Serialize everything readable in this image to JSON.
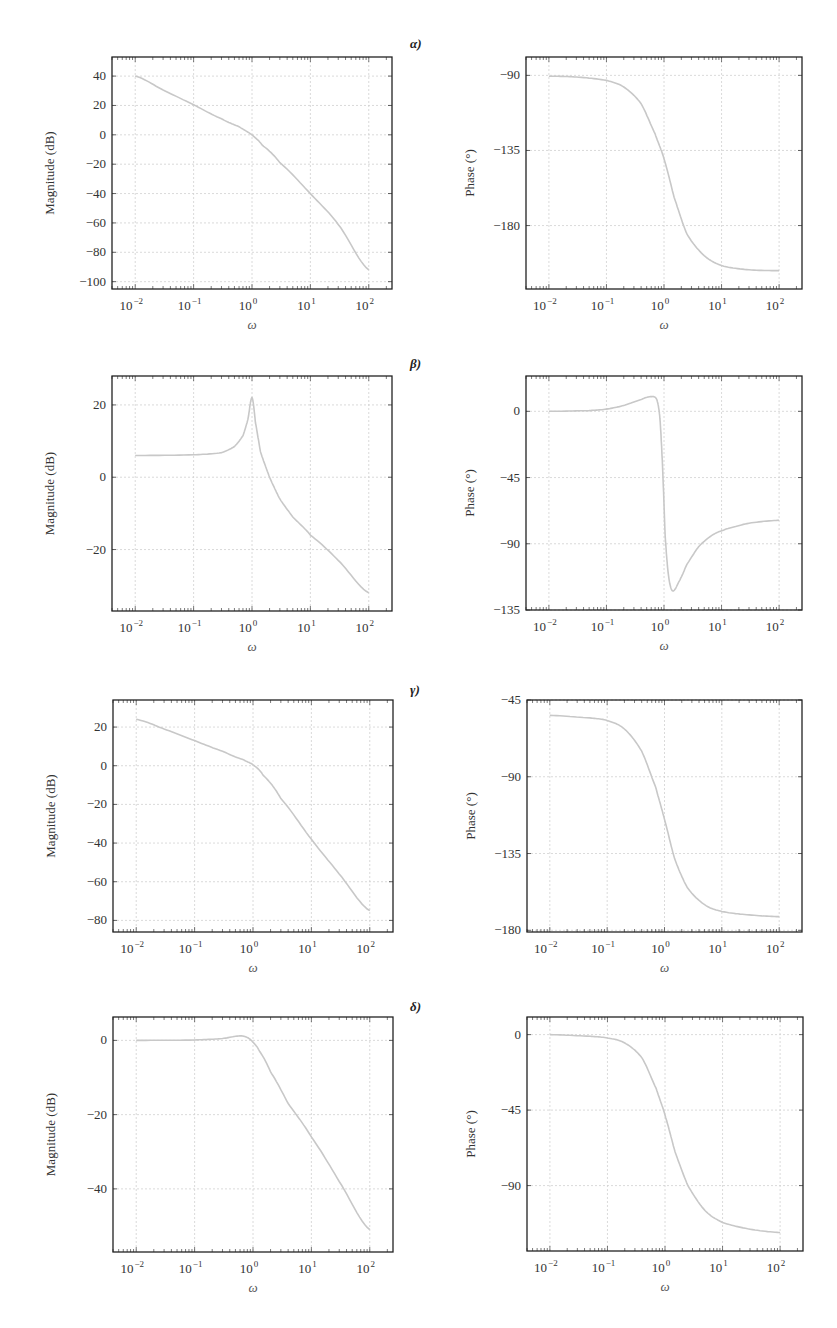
{
  "panel_labels": [
    "α)",
    "β)",
    "γ)",
    "δ)"
  ],
  "colors": {
    "curve": "#c8c8c8",
    "grid": "#d0d0d0",
    "axis": "#222222"
  },
  "chart_data": [
    {
      "id": "alpha-magnitude",
      "panel": "α)",
      "type": "line",
      "xlabel": "ω",
      "ylabel": "Magnitude (dB)",
      "xscale": "log",
      "xlim": [
        0.004,
        250
      ],
      "ylim": [
        -105,
        53
      ],
      "xticks": [
        0.01,
        0.1,
        1,
        10,
        100
      ],
      "xtick_labels": [
        "10^-2",
        "10^-1",
        "10^0",
        "10^1",
        "10^2"
      ],
      "yticks": [
        40,
        20,
        0,
        -20,
        -40,
        -60,
        -80,
        -100
      ],
      "ytick_labels": [
        "40",
        "20",
        "0",
        "−20",
        "−40",
        "−60",
        "−80",
        "−100"
      ],
      "box": [
        112,
        57,
        392,
        289
      ],
      "x": [
        0.01,
        0.03,
        0.1,
        0.3,
        0.6,
        1,
        1.5,
        3,
        10,
        30,
        100
      ],
      "y": [
        40,
        30.5,
        20.5,
        11,
        5.5,
        0,
        -7,
        -19,
        -40,
        -61,
        -92
      ]
    },
    {
      "id": "alpha-phase",
      "panel": "α)",
      "type": "line",
      "xlabel": "ω",
      "ylabel": "Phase (°)",
      "xscale": "log",
      "xlim": [
        0.004,
        250
      ],
      "ylim": [
        -218,
        -79
      ],
      "xticks": [
        0.01,
        0.1,
        1,
        10,
        100
      ],
      "xtick_labels": [
        "10^-2",
        "10^-1",
        "10^0",
        "10^1",
        "10^2"
      ],
      "yticks": [
        -90,
        -135,
        -180
      ],
      "ytick_labels": [
        "−90",
        "−135",
        "−180"
      ],
      "box": [
        526,
        57,
        802,
        289
      ],
      "x": [
        0.01,
        0.03,
        0.1,
        0.2,
        0.4,
        0.7,
        1,
        1.5,
        2.5,
        5,
        10,
        30,
        100
      ],
      "y": [
        -90.5,
        -91,
        -93,
        -97,
        -107,
        -125,
        -140,
        -163,
        -185,
        -198,
        -204,
        -206.5,
        -207
      ]
    },
    {
      "id": "beta-magnitude",
      "panel": "β)",
      "type": "line",
      "xlabel": "ω",
      "ylabel": "Magnitude (dB)",
      "xscale": "log",
      "xlim": [
        0.004,
        250
      ],
      "ylim": [
        -37,
        28
      ],
      "xticks": [
        0.01,
        0.1,
        1,
        10,
        100
      ],
      "xtick_labels": [
        "10^-2",
        "10^-1",
        "10^0",
        "10^1",
        "10^2"
      ],
      "yticks": [
        20,
        0,
        -20
      ],
      "ytick_labels": [
        "20",
        "0",
        "−20"
      ],
      "box": [
        112,
        376,
        392,
        611
      ],
      "x": [
        0.01,
        0.1,
        0.3,
        0.5,
        0.7,
        0.85,
        1,
        1.15,
        1.4,
        2,
        3,
        5,
        10,
        30,
        100
      ],
      "y": [
        6,
        6.2,
        6.8,
        8.5,
        11.5,
        16,
        22,
        15,
        7,
        0,
        -6,
        -11,
        -16,
        -23,
        -32
      ]
    },
    {
      "id": "beta-phase",
      "panel": "β)",
      "type": "line",
      "xlabel": "ω",
      "ylabel": "Phase (°)",
      "xscale": "log",
      "xlim": [
        0.004,
        250
      ],
      "ylim": [
        -135,
        24
      ],
      "xticks": [
        0.01,
        0.1,
        1,
        10,
        100
      ],
      "xtick_labels": [
        "10^-2",
        "10^-1",
        "10^0",
        "10^1",
        "10^2"
      ],
      "yticks": [
        0,
        -45,
        -90,
        -135
      ],
      "ytick_labels": [
        "0",
        "−45",
        "−90",
        "−135"
      ],
      "box": [
        526,
        376,
        802,
        610
      ],
      "x": [
        0.01,
        0.05,
        0.1,
        0.2,
        0.4,
        0.6,
        0.75,
        0.85,
        0.95,
        1.05,
        1.2,
        1.4,
        1.8,
        2.5,
        4,
        7,
        12,
        30,
        100
      ],
      "y": [
        0,
        0.5,
        1.5,
        4,
        8,
        10,
        8,
        -5,
        -40,
        -85,
        -112,
        -122,
        -116,
        -104,
        -92,
        -84,
        -80,
        -76,
        -74
      ]
    },
    {
      "id": "gamma-magnitude",
      "panel": "γ)",
      "type": "line",
      "xlabel": "ω",
      "ylabel": "Magnitude (dB)",
      "xscale": "log",
      "xlim": [
        0.004,
        250
      ],
      "ylim": [
        -86,
        34
      ],
      "xticks": [
        0.01,
        0.1,
        1,
        10,
        100
      ],
      "xtick_labels": [
        "10^-2",
        "10^-1",
        "10^0",
        "10^1",
        "10^2"
      ],
      "yticks": [
        20,
        0,
        -20,
        -40,
        -60,
        -80
      ],
      "ytick_labels": [
        "20",
        "0",
        "−20",
        "−40",
        "−60",
        "−80"
      ],
      "box": [
        113,
        700,
        393,
        932
      ],
      "x": [
        0.01,
        0.03,
        0.1,
        0.3,
        0.7,
        1,
        1.5,
        3,
        10,
        30,
        100
      ],
      "y": [
        24,
        19,
        13,
        7.5,
        3,
        0.5,
        -5,
        -17,
        -38,
        -56,
        -75
      ]
    },
    {
      "id": "gamma-phase",
      "panel": "γ)",
      "type": "line",
      "xlabel": "ω",
      "ylabel": "Phase (°)",
      "xscale": "log",
      "xlim": [
        0.004,
        250
      ],
      "ylim": [
        -181,
        -45
      ],
      "xticks": [
        0.01,
        0.1,
        1,
        10,
        100
      ],
      "xtick_labels": [
        "10^-2",
        "10^-1",
        "10^0",
        "10^1",
        "10^2"
      ],
      "yticks": [
        -45,
        -90,
        -135,
        -180
      ],
      "ytick_labels": [
        "−45",
        "−90",
        "−135",
        "−180"
      ],
      "box": [
        527,
        700,
        802,
        932
      ],
      "x": [
        0.01,
        0.05,
        0.1,
        0.2,
        0.4,
        0.7,
        1,
        1.5,
        2.5,
        5,
        10,
        30,
        100
      ],
      "y": [
        -54,
        -55.5,
        -57,
        -62,
        -75,
        -96,
        -115,
        -138,
        -155,
        -165,
        -169,
        -171,
        -172
      ]
    },
    {
      "id": "delta-magnitude",
      "panel": "δ)",
      "type": "line",
      "xlabel": "ω",
      "ylabel": "Magnitude (dB)",
      "xscale": "log",
      "xlim": [
        0.004,
        250
      ],
      "ylim": [
        -57,
        6.3
      ],
      "xticks": [
        0.01,
        0.1,
        1,
        10,
        100
      ],
      "xtick_labels": [
        "10^-2",
        "10^-1",
        "10^0",
        "10^1",
        "10^2"
      ],
      "yticks": [
        0,
        -20,
        -40
      ],
      "ytick_labels": [
        "0",
        "−20",
        "−40"
      ],
      "box": [
        113,
        1017,
        393,
        1252
      ],
      "x": [
        0.01,
        0.1,
        0.3,
        0.6,
        0.8,
        1,
        1.3,
        2,
        4,
        10,
        30,
        100
      ],
      "y": [
        0,
        0.1,
        0.5,
        1.2,
        0.8,
        -0.5,
        -3,
        -8.5,
        -17,
        -26,
        -38,
        -51
      ]
    },
    {
      "id": "delta-phase",
      "panel": "δ)",
      "type": "line",
      "xlabel": "ω",
      "ylabel": "Phase (°)",
      "xscale": "log",
      "xlim": [
        0.004,
        250
      ],
      "ylim": [
        -129,
        10.5
      ],
      "xticks": [
        0.01,
        0.1,
        1,
        10,
        100
      ],
      "xtick_labels": [
        "10^-2",
        "10^-1",
        "10^0",
        "10^1",
        "10^2"
      ],
      "yticks": [
        0,
        -45,
        -90
      ],
      "ytick_labels": [
        "0",
        "−45",
        "−90"
      ],
      "box": [
        527,
        1017,
        803,
        1251
      ],
      "x": [
        0.01,
        0.05,
        0.1,
        0.2,
        0.4,
        0.7,
        1,
        1.5,
        2.5,
        5,
        10,
        30,
        100
      ],
      "y": [
        0,
        -1,
        -2,
        -5,
        -14,
        -32,
        -48,
        -70,
        -90,
        -105,
        -112,
        -116,
        -118
      ]
    }
  ]
}
